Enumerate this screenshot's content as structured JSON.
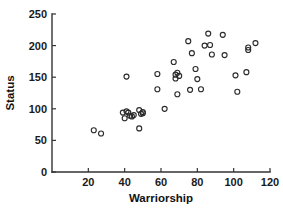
{
  "chart_data": {
    "type": "scatter",
    "title": "",
    "xlabel": "Warriorship",
    "ylabel": "Status",
    "xlim": [
      0,
      120
    ],
    "ylim": [
      0,
      250
    ],
    "xticks": [
      20,
      40,
      60,
      80,
      100,
      120
    ],
    "yticks": [
      0,
      50,
      100,
      150,
      200,
      250
    ],
    "grid": false,
    "legend": null,
    "marker": "open-circle",
    "marker_color": "#2b2b2b",
    "n_points": 40,
    "x": [
      23,
      27,
      39,
      40,
      41,
      42,
      43,
      44,
      45,
      48,
      48,
      49,
      50,
      50,
      58,
      58,
      62,
      67,
      68,
      68,
      69,
      69,
      70,
      75,
      76,
      77,
      79,
      80,
      82,
      84,
      86,
      87,
      88,
      94,
      95,
      101,
      102,
      107,
      108,
      108,
      112
    ],
    "y": [
      66,
      61,
      94,
      85,
      96,
      94,
      89,
      88,
      90,
      69,
      98,
      92,
      95,
      93,
      155,
      131,
      100,
      174,
      154,
      148,
      157,
      123,
      152,
      207,
      130,
      188,
      163,
      147,
      131,
      200,
      219,
      201,
      186,
      217,
      185,
      153,
      127,
      158,
      197,
      193,
      204
    ],
    "points": [
      {
        "x": 23,
        "y": 66
      },
      {
        "x": 27,
        "y": 61
      },
      {
        "x": 39,
        "y": 94
      },
      {
        "x": 40,
        "y": 85
      },
      {
        "x": 41,
        "y": 96
      },
      {
        "x": 42,
        "y": 94
      },
      {
        "x": 43,
        "y": 89
      },
      {
        "x": 44,
        "y": 88
      },
      {
        "x": 45,
        "y": 90
      },
      {
        "x": 48,
        "y": 69
      },
      {
        "x": 48,
        "y": 98
      },
      {
        "x": 49,
        "y": 92
      },
      {
        "x": 50,
        "y": 95
      },
      {
        "x": 50,
        "y": 93
      },
      {
        "x": 41,
        "y": 151
      },
      {
        "x": 58,
        "y": 155
      },
      {
        "x": 58,
        "y": 131
      },
      {
        "x": 62,
        "y": 100
      },
      {
        "x": 67,
        "y": 174
      },
      {
        "x": 68,
        "y": 154
      },
      {
        "x": 68,
        "y": 148
      },
      {
        "x": 69,
        "y": 157
      },
      {
        "x": 69,
        "y": 123
      },
      {
        "x": 70,
        "y": 152
      },
      {
        "x": 75,
        "y": 207
      },
      {
        "x": 76,
        "y": 130
      },
      {
        "x": 77,
        "y": 188
      },
      {
        "x": 79,
        "y": 163
      },
      {
        "x": 80,
        "y": 147
      },
      {
        "x": 82,
        "y": 131
      },
      {
        "x": 84,
        "y": 200
      },
      {
        "x": 86,
        "y": 219
      },
      {
        "x": 87,
        "y": 201
      },
      {
        "x": 88,
        "y": 186
      },
      {
        "x": 94,
        "y": 217
      },
      {
        "x": 95,
        "y": 185
      },
      {
        "x": 101,
        "y": 153
      },
      {
        "x": 102,
        "y": 127
      },
      {
        "x": 107,
        "y": 158
      },
      {
        "x": 108,
        "y": 197
      },
      {
        "x": 108,
        "y": 193
      },
      {
        "x": 112,
        "y": 204
      }
    ]
  }
}
